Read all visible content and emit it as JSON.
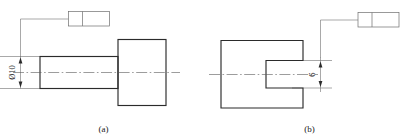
{
  "sheet": {
    "background_color": "#ffffff",
    "line_color": "#2b2b2b",
    "thin_line_color": "#6e6e6e",
    "text_color": "#1a1a1a"
  },
  "figures": [
    {
      "id": "a",
      "caption": "(a)",
      "part_description": "stepped shaft with head",
      "dimension": {
        "label": "Ø10",
        "value": "10",
        "symbol": "Ø",
        "orientation": "vertical",
        "arrows": "both"
      },
      "feature_control_frame": {
        "cells": [
          "",
          ""
        ],
        "filled": false
      },
      "centerline": true
    },
    {
      "id": "b",
      "caption": "(b)",
      "part_description": "block with open slot",
      "dimension": {
        "label": "6",
        "value": "6",
        "symbol": "",
        "orientation": "vertical",
        "arrows": "both"
      },
      "feature_control_frame": {
        "cells": [
          "",
          ""
        ],
        "filled": false
      },
      "centerline": true
    }
  ]
}
